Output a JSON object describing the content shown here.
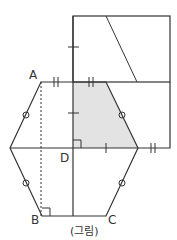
{
  "figure": {
    "caption": "(그림)",
    "labels": {
      "A": "A",
      "B": "B",
      "C": "C",
      "D": "D"
    },
    "colors": {
      "stroke": "#333333",
      "shade": "#e3e3e3"
    }
  }
}
